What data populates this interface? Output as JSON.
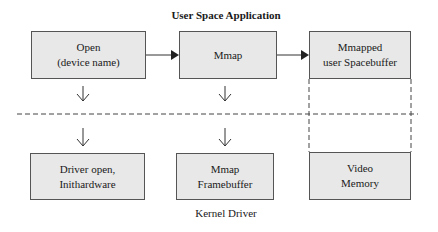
{
  "title": "User Space Application",
  "caption": "Kernel Driver",
  "user_space": {
    "boxes": [
      {
        "line1": "Open",
        "line2": "(device name)"
      },
      {
        "line1": "Mmap",
        "line2": ""
      },
      {
        "line1": "Mmapped",
        "line2": "user Spacebuffer"
      }
    ]
  },
  "kernel": {
    "boxes": [
      {
        "line1": "Driver open,",
        "line2": "Inithardware"
      },
      {
        "line1": "Mmap",
        "line2": "Framebuffer"
      },
      {
        "line1": "Video",
        "line2": "Memory"
      }
    ]
  },
  "colors": {
    "box_fill": "#e8e8e8",
    "box_border": "#555555",
    "line": "#333333"
  }
}
